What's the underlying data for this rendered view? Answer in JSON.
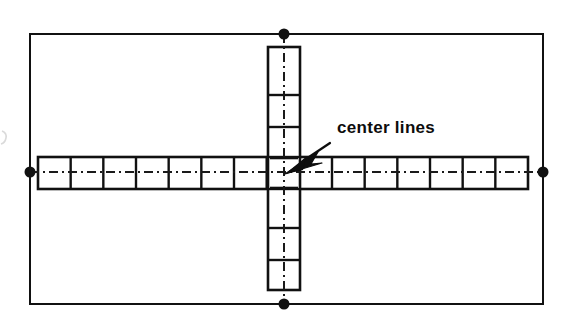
{
  "figure": {
    "kind": "engineering-drawing",
    "background_color": "#ffffff",
    "line_color": "#111111",
    "centerline_color": "#1a1a1a"
  },
  "annotation": {
    "label": "center lines",
    "label_x": 337,
    "label_y": 133,
    "arrow": {
      "name": "leader-arrow",
      "tail_x": 330,
      "tail_y": 143,
      "tip_x": 285,
      "tip_y": 173
    }
  },
  "outer_boundary": {
    "name": "outer-rectangle",
    "x": 30,
    "y": 34,
    "width": 513,
    "height": 270,
    "stroke_width": 2
  },
  "horizontal_bar": {
    "name": "horizontal-module-row",
    "x": 38,
    "y": 157,
    "width": 490,
    "height": 32,
    "cell_count": 15,
    "cell_width": 32.7
  },
  "vertical_bar": {
    "name": "vertical-module-column",
    "x": 268,
    "y": 47,
    "width": 32,
    "height": 243,
    "divider_y": [
      95,
      127,
      157,
      189,
      228,
      260
    ]
  },
  "center_lines": {
    "horizontal": {
      "name": "horizontal-center-line",
      "x1": 30,
      "x2": 543,
      "y": 172
    },
    "vertical": {
      "name": "vertical-center-line",
      "x": 284,
      "y1": 34,
      "y2": 304
    },
    "dash_pattern": "9 4 2 4"
  },
  "endpoint_markers": [
    {
      "name": "top-center-marker",
      "cx": 284,
      "cy": 34,
      "r": 5.5
    },
    {
      "name": "left-center-marker",
      "cx": 30,
      "cy": 172,
      "r": 5.5
    },
    {
      "name": "right-center-marker",
      "cx": 543,
      "cy": 172,
      "r": 5.5
    },
    {
      "name": "bottom-center-marker",
      "cx": 284,
      "cy": 304,
      "r": 5.5
    }
  ]
}
